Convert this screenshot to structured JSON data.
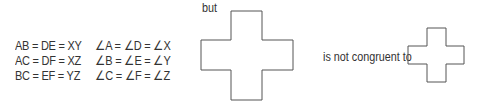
{
  "sides": {
    "rows": [
      "AB = DE = XY",
      "AC = DF = XZ",
      "BC = EF = YZ"
    ]
  },
  "angles": {
    "rows": [
      "∠A = ∠D = ∠X",
      "∠B = ∠E = ∠Y",
      "∠C = ∠F = ∠Z"
    ]
  },
  "labels": {
    "but": "but",
    "not_congruent": "is not congruent to"
  },
  "shapes": {
    "large_cross": "cross",
    "small_cross": "cross",
    "stroke_color": "#555555"
  }
}
